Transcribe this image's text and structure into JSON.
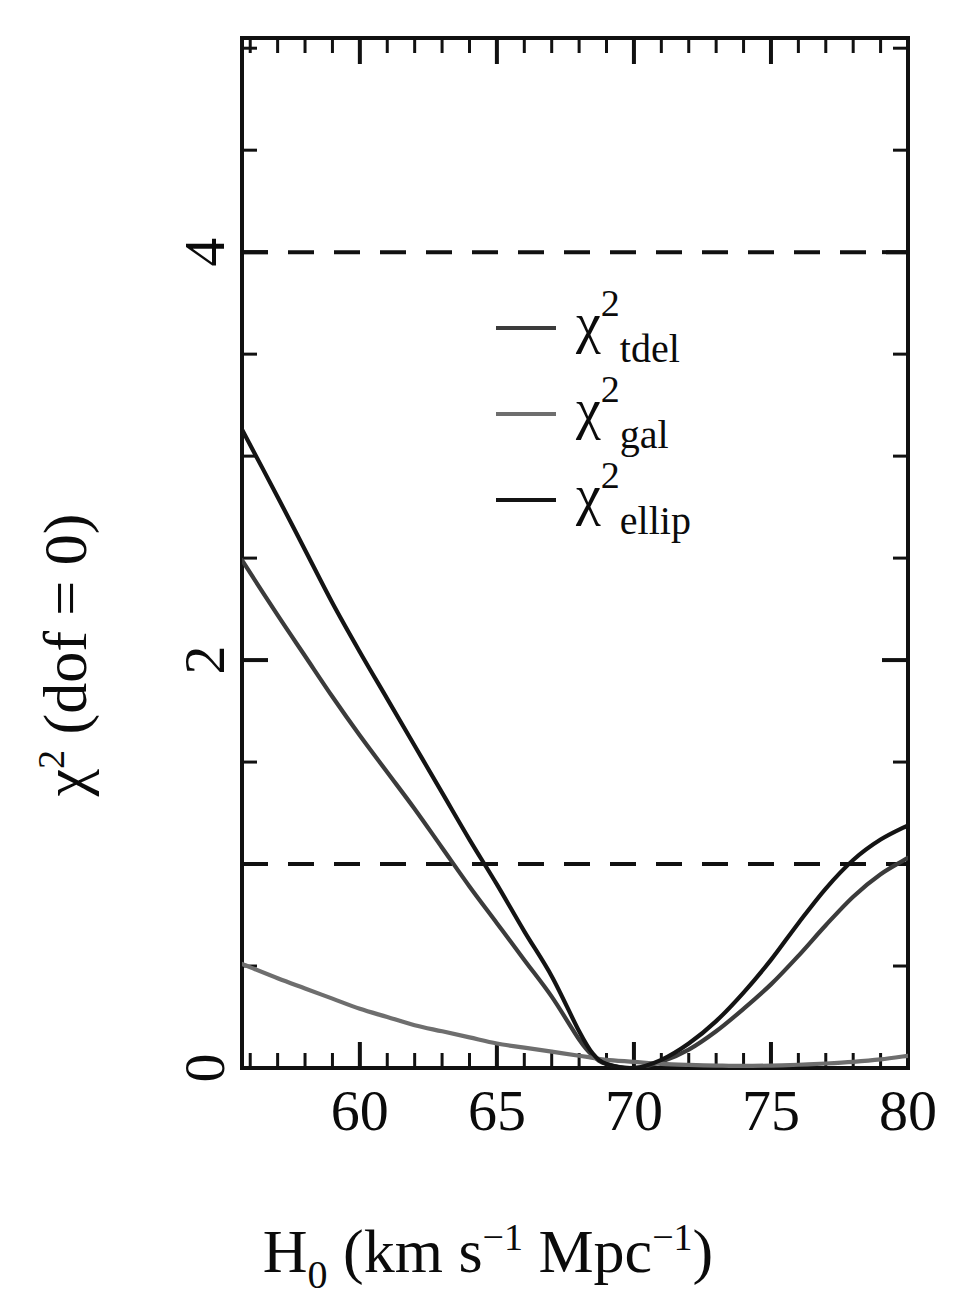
{
  "figure": {
    "background": "#ffffff",
    "ink": "#111111"
  },
  "axes": {
    "x_title_parts": {
      "symbol": "H",
      "symbol_sub": "0",
      "open": " (km s",
      "exp1": "−1",
      "mid": " Mpc",
      "exp2": "−1",
      "close": ")"
    },
    "x_title_plain": "H0 (km s^-1 Mpc^-1)",
    "y_title_parts": {
      "symbol": "χ",
      "symbol_sup": "2",
      "rest": " (dof = 0)"
    },
    "y_title_plain": "chi^2 (dof = 0)",
    "x_tick_labels": [
      "60",
      "65",
      "70",
      "75",
      "80"
    ],
    "x_tick_values": [
      60,
      65,
      70,
      75,
      80
    ],
    "y_tick_labels": [
      "0",
      "2",
      "4"
    ],
    "y_tick_values": [
      0,
      2,
      4
    ]
  },
  "legend": {
    "position": "upper-center-right",
    "entries": [
      {
        "symbol": "χ",
        "sup": "2",
        "sub": "tdel",
        "label": "χ² tdel",
        "color": "#3b3b3b",
        "width": 4
      },
      {
        "symbol": "χ",
        "sup": "2",
        "sub": "gal",
        "label": "χ² gal",
        "color": "#6e6e6e",
        "width": 4
      },
      {
        "symbol": "χ",
        "sup": "2",
        "sub": "ellip",
        "label": "χ² ellip",
        "color": "#141414",
        "width": 4
      }
    ]
  },
  "chart_data": {
    "type": "line",
    "title": "",
    "xlabel": "H0 (km s^-1 Mpc^-1)",
    "ylabel": "chi^2 (dof = 0)",
    "xlim": [
      55.7,
      80.0
    ],
    "ylim": [
      0.0,
      5.05
    ],
    "grid": false,
    "legend_position": "upper-center-right",
    "annotations": [
      {
        "type": "hline",
        "y": 1,
        "style": "dashed",
        "label": "delta chi^2 = 1"
      },
      {
        "type": "hline",
        "y": 4,
        "style": "dashed",
        "label": "delta chi^2 = 4"
      }
    ],
    "x": [
      55.7,
      57,
      58,
      59,
      60,
      61,
      62,
      63,
      64,
      65,
      66,
      67,
      68,
      68.5,
      69,
      70,
      71,
      72,
      73,
      74,
      75,
      76,
      77,
      78,
      79,
      80
    ],
    "series": [
      {
        "name": "chi^2_tdel",
        "color": "#3b3b3b",
        "values": [
          2.49,
          2.22,
          2.02,
          1.82,
          1.63,
          1.45,
          1.27,
          1.08,
          0.89,
          0.71,
          0.53,
          0.35,
          0.14,
          0.06,
          0.02,
          0.0,
          0.03,
          0.09,
          0.18,
          0.29,
          0.41,
          0.55,
          0.7,
          0.84,
          0.95,
          1.03
        ]
      },
      {
        "name": "chi^2_gal",
        "color": "#6e6e6e",
        "values": [
          0.51,
          0.44,
          0.39,
          0.34,
          0.29,
          0.25,
          0.21,
          0.18,
          0.15,
          0.12,
          0.1,
          0.08,
          0.06,
          0.05,
          0.04,
          0.03,
          0.02,
          0.015,
          0.012,
          0.01,
          0.012,
          0.016,
          0.022,
          0.03,
          0.042,
          0.06
        ]
      },
      {
        "name": "chi^2_ellip",
        "color": "#141414",
        "values": [
          3.13,
          2.8,
          2.54,
          2.28,
          2.04,
          1.81,
          1.58,
          1.35,
          1.12,
          0.9,
          0.67,
          0.45,
          0.18,
          0.07,
          0.02,
          0.0,
          0.04,
          0.12,
          0.23,
          0.37,
          0.53,
          0.71,
          0.88,
          1.02,
          1.12,
          1.19
        ]
      }
    ]
  },
  "ticks": {
    "x_minor_count_between": 4,
    "y_minor_count_between": 3
  }
}
